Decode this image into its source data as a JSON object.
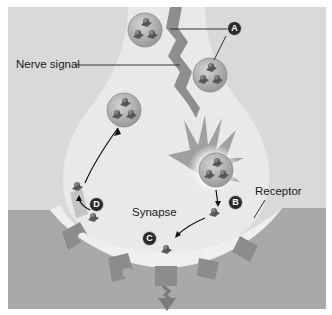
{
  "figure": {
    "title_partial": "",
    "labels": {
      "nerve_signal": "Nerve signal",
      "synapse": "Synapse",
      "receptor": "Receptor"
    },
    "markers": {
      "a": "A",
      "b": "B",
      "c": "C",
      "d": "D"
    },
    "colors": {
      "panel_bg": "#d9d9d9",
      "neuron_fill": "#e9e9e9",
      "postsynaptic_fill": "#a9a9a9",
      "receptor_fill": "#8c8c8c",
      "vesicle_fill": "#b5b5b5",
      "signal_bolt": "#8e8e8e",
      "marker_bg": "#2a2a2a"
    }
  }
}
